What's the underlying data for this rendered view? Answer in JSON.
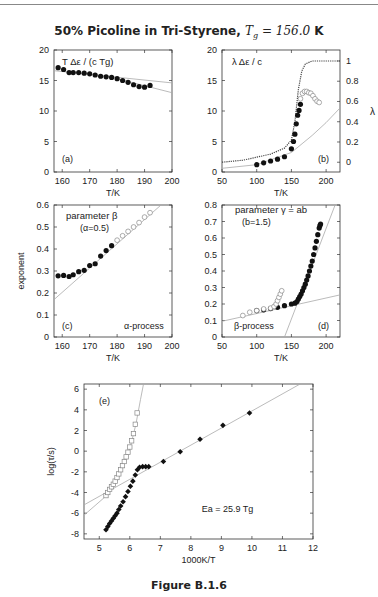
{
  "header": {
    "title_prefix": "50% Picoline in Tri-Styrene, ",
    "title_math": "Tg = 156.0 K"
  },
  "caption": "Figure B.1.6",
  "chart_data": [
    {
      "panel": "a",
      "type": "scatter",
      "title": "T Δε / (c Tg)",
      "label": "(a)",
      "xlabel": "T/K",
      "ylabel": "",
      "xlim": [
        157,
        200
      ],
      "ylim": [
        0,
        20
      ],
      "xticks": [
        160,
        170,
        180,
        190,
        200
      ],
      "yticks": [
        0,
        5,
        10,
        15,
        20
      ],
      "series": [
        {
          "name": "data",
          "marker": "filled-circle",
          "x": [
            158.5,
            160.5,
            162.5,
            164,
            166,
            168,
            170,
            172,
            174,
            176,
            178,
            180,
            182,
            184,
            186,
            188,
            190,
            192
          ],
          "y": [
            17.1,
            16.8,
            16.3,
            16.3,
            16.3,
            16.2,
            16.1,
            15.9,
            15.7,
            15.6,
            15.5,
            15.3,
            15.0,
            14.7,
            14.3,
            14.0,
            13.9,
            14.2
          ]
        },
        {
          "name": "fit-1",
          "style": "gray-line",
          "x": [
            157,
            200
          ],
          "y": [
            16.6,
            14.6
          ]
        },
        {
          "name": "fit-2",
          "style": "gray-line",
          "x": [
            180,
            200
          ],
          "y": [
            15.3,
            13.0
          ]
        }
      ]
    },
    {
      "panel": "b",
      "type": "scatter",
      "title": "λ Δε / c",
      "label": "(b)",
      "xlabel": "T/K",
      "ylabel_right": "λ",
      "xlim": [
        50,
        220
      ],
      "ylim": [
        0,
        20
      ],
      "xticks": [
        50,
        100,
        150,
        200
      ],
      "yticks": [
        0,
        5,
        10,
        15,
        20
      ],
      "y2ticks": [
        0,
        0.2,
        0.4,
        0.6,
        0.8,
        1
      ],
      "series": [
        {
          "name": "filled",
          "marker": "filled-circle",
          "x": [
            100,
            110,
            120,
            130,
            140,
            150,
            153,
            155,
            157,
            159,
            161,
            163
          ],
          "y": [
            1.2,
            1.5,
            1.8,
            2.1,
            2.5,
            3.8,
            5.0,
            6.2,
            7.9,
            9.3,
            10.1,
            11.1
          ]
        },
        {
          "name": "open",
          "marker": "open-circle",
          "x": [
            163,
            166,
            169,
            172,
            175,
            178,
            181,
            184,
            187,
            190
          ],
          "y": [
            12.0,
            12.9,
            13.2,
            13.2,
            13.0,
            12.9,
            12.5,
            12.0,
            11.6,
            11.4
          ]
        },
        {
          "name": "lambda",
          "style": "dotted-line-right-axis",
          "x": [
            50,
            80,
            100,
            120,
            140,
            150,
            155,
            160,
            165,
            170,
            180,
            220
          ],
          "y2": [
            0,
            0.02,
            0.05,
            0.08,
            0.14,
            0.22,
            0.4,
            0.72,
            0.9,
            0.97,
            1.0,
            1.0
          ]
        },
        {
          "name": "gray-fit",
          "style": "gray-line",
          "x": [
            50,
            100,
            150,
            180,
            200,
            220
          ],
          "y": [
            0.6,
            1.2,
            3.2,
            6.0,
            8.1,
            10.5
          ]
        }
      ]
    },
    {
      "panel": "c",
      "type": "scatter",
      "title": "parameter β",
      "subtitle": "(α=0.5)",
      "label": "(c)",
      "annotation": "α-process",
      "xlabel": "T/K",
      "ylabel": "exponent",
      "xlim": [
        157,
        200
      ],
      "ylim": [
        0,
        0.6
      ],
      "xticks": [
        160,
        170,
        180,
        190,
        200
      ],
      "yticks": [
        0,
        0.1,
        0.2,
        0.3,
        0.4,
        0.5,
        0.6
      ],
      "series": [
        {
          "name": "filled",
          "marker": "filled-circle",
          "x": [
            158.5,
            160.5,
            162.5,
            164,
            166,
            168,
            170,
            172,
            174,
            176,
            178
          ],
          "y": [
            0.278,
            0.28,
            0.275,
            0.283,
            0.297,
            0.303,
            0.325,
            0.333,
            0.368,
            0.393,
            0.415
          ]
        },
        {
          "name": "open",
          "marker": "open-circle",
          "x": [
            180,
            182,
            184,
            186,
            188,
            190,
            192
          ],
          "y": [
            0.44,
            0.46,
            0.48,
            0.5,
            0.52,
            0.545,
            0.565
          ]
        },
        {
          "name": "fit",
          "style": "gray-line",
          "x": [
            157,
            196
          ],
          "y": [
            0.17,
            0.6
          ]
        }
      ]
    },
    {
      "panel": "d",
      "type": "scatter",
      "title": "parameter γ = ab",
      "subtitle": "(b=1.5)",
      "label": "(d)",
      "annotation": "β-process",
      "xlabel": "T/K",
      "ylabel": "",
      "xlim": [
        50,
        220
      ],
      "ylim": [
        0,
        0.8
      ],
      "xticks": [
        50,
        100,
        150,
        200
      ],
      "yticks": [
        0,
        0.1,
        0.2,
        0.3,
        0.4,
        0.5,
        0.6,
        0.7,
        0.8
      ],
      "series": [
        {
          "name": "filled",
          "marker": "filled-circle",
          "x": [
            100,
            110,
            120,
            130,
            140,
            150,
            155,
            158,
            160,
            162,
            164,
            166,
            168,
            170,
            172,
            174,
            176,
            178,
            180,
            182,
            184,
            186,
            188,
            190,
            191,
            192
          ],
          "y": [
            0.16,
            0.165,
            0.172,
            0.18,
            0.19,
            0.2,
            0.205,
            0.215,
            0.23,
            0.245,
            0.26,
            0.28,
            0.3,
            0.32,
            0.345,
            0.37,
            0.4,
            0.43,
            0.46,
            0.5,
            0.54,
            0.58,
            0.62,
            0.66,
            0.675,
            0.685
          ]
        },
        {
          "name": "open",
          "marker": "open-circle",
          "x": [
            80,
            90,
            100,
            110,
            120,
            125,
            128,
            130,
            132,
            134,
            136
          ],
          "y": [
            0.13,
            0.15,
            0.16,
            0.17,
            0.175,
            0.185,
            0.2,
            0.22,
            0.24,
            0.26,
            0.28
          ]
        },
        {
          "name": "fit-low",
          "style": "gray-line",
          "x": [
            50,
            220
          ],
          "y": [
            0.095,
            0.255
          ]
        },
        {
          "name": "fit-high",
          "style": "gray-line",
          "x": [
            140,
            213
          ],
          "y": [
            0.0,
            0.8
          ]
        }
      ]
    },
    {
      "panel": "e",
      "type": "scatter",
      "label": "(e)",
      "annotation": "Ea = 25.9 Tg",
      "xlabel": "1000K/T",
      "ylabel": "log(τ/s)",
      "xlim": [
        4.5,
        12
      ],
      "ylim": [
        -8.5,
        6.5
      ],
      "xticks": [
        5,
        6,
        7,
        8,
        9,
        10,
        11,
        12
      ],
      "yticks": [
        -8,
        -6,
        -4,
        -2,
        0,
        2,
        4,
        6
      ],
      "series": [
        {
          "name": "filled",
          "marker": "filled-diamond",
          "x": [
            5.22,
            5.28,
            5.34,
            5.4,
            5.46,
            5.52,
            5.58,
            5.64,
            5.7,
            5.78,
            5.86,
            5.94,
            6.02,
            6.1,
            6.18,
            6.25,
            6.32,
            6.42,
            6.52,
            6.62,
            7.1,
            7.65,
            8.3,
            9.05,
            9.92
          ],
          "y": [
            -7.6,
            -7.3,
            -7.0,
            -6.75,
            -6.5,
            -6.25,
            -6.0,
            -5.65,
            -5.3,
            -4.9,
            -4.4,
            -3.9,
            -3.4,
            -2.9,
            -2.3,
            -1.8,
            -1.55,
            -1.5,
            -1.5,
            -1.5,
            -1.0,
            -0.05,
            1.15,
            2.5,
            3.7
          ]
        },
        {
          "name": "open",
          "marker": "open-square",
          "x": [
            5.22,
            5.28,
            5.34,
            5.4,
            5.46,
            5.52,
            5.58,
            5.64,
            5.7,
            5.76,
            5.82,
            5.88,
            5.94,
            6.0,
            6.06,
            6.12,
            6.18,
            6.24
          ],
          "y": [
            -4.3,
            -4.0,
            -3.7,
            -3.45,
            -3.2,
            -2.9,
            -2.55,
            -2.2,
            -1.8,
            -1.4,
            -1.0,
            -0.55,
            -0.1,
            0.4,
            1.0,
            1.7,
            2.6,
            3.7
          ]
        },
        {
          "name": "vft-fit",
          "style": "gray-line",
          "x": [
            4.5,
            5.2,
            5.6,
            6.0,
            6.2,
            6.35,
            6.45
          ],
          "y": [
            -6.2,
            -4.4,
            -2.8,
            0.2,
            2.6,
            5.0,
            6.5
          ]
        },
        {
          "name": "arrhenius-fit",
          "style": "gray-line",
          "x": [
            4.5,
            12.0
          ],
          "y": [
            -5.2,
            7.2
          ]
        }
      ]
    }
  ]
}
